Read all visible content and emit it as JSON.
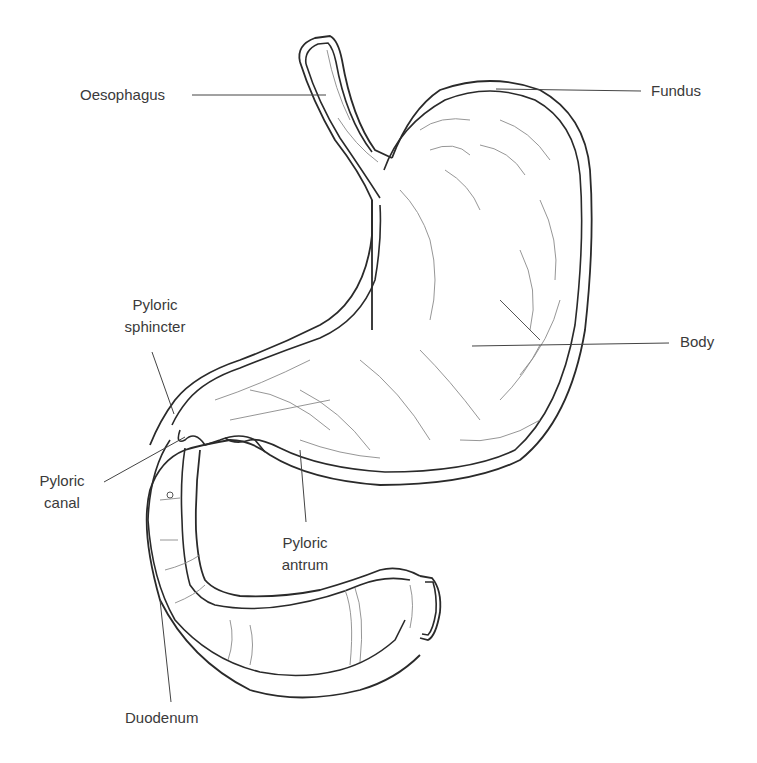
{
  "diagram": {
    "labels": {
      "oesophagus": [
        "Oesophagus"
      ],
      "fundus": [
        "Fundus"
      ],
      "pyloric_sphincter": [
        "Pyloric",
        "sphincter"
      ],
      "body": [
        "Body"
      ],
      "pyloric_canal": [
        "Pyloric",
        "canal"
      ],
      "pyloric_antrum": [
        "Pyloric",
        "antrum"
      ],
      "duodenum": [
        "Duodenum"
      ]
    },
    "colors": {
      "outline": "#2a2a2a",
      "folds": "#8a8a8a",
      "text": "#3a3a3a",
      "background": "#ffffff"
    }
  }
}
